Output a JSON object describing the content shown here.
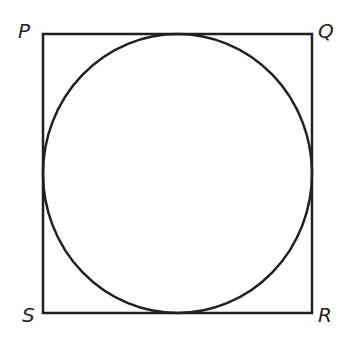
{
  "diagram": {
    "type": "square-with-inscribed-circle",
    "stroke_color": "#231f20",
    "vertices": {
      "P": {
        "label": "P",
        "x": 43,
        "y": 34
      },
      "Q": {
        "label": "Q",
        "x": 312,
        "y": 34
      },
      "R": {
        "label": "R",
        "x": 312,
        "y": 313
      },
      "S": {
        "label": "S",
        "x": 43,
        "y": 313
      }
    },
    "circle": {
      "cx": 177.5,
      "cy": 173.5,
      "rx": 134.5,
      "ry": 139.5
    }
  }
}
